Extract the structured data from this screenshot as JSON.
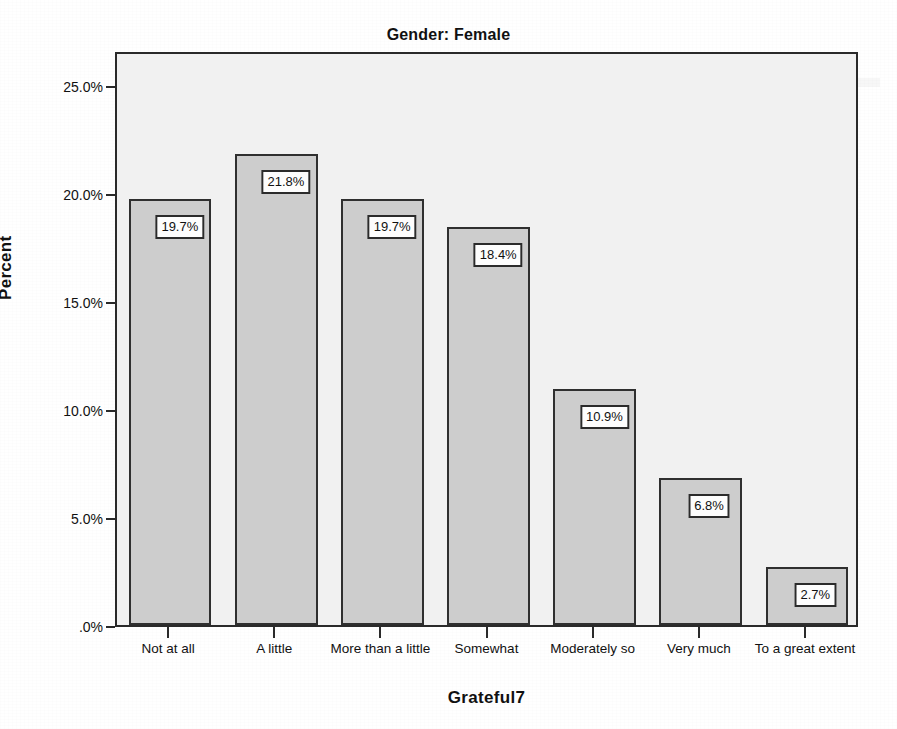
{
  "chart_data": {
    "type": "bar",
    "title": "Gender: Female",
    "xlabel": "Grateful7",
    "ylabel": "Percent",
    "categories": [
      "Not at all",
      "A little",
      "More than a little",
      "Somewhat",
      "Moderately so",
      "Very much",
      "To a great extent"
    ],
    "values": [
      19.7,
      21.8,
      19.7,
      18.4,
      10.9,
      6.8,
      2.7
    ],
    "value_labels": [
      "19.7%",
      "21.8%",
      "19.7%",
      "18.4%",
      "10.9%",
      "6.8%",
      "2.7%"
    ],
    "ylim": [
      0,
      26.6
    ],
    "ytick_values": [
      25.0,
      20.0,
      15.0,
      10.0,
      5.0,
      0.0
    ],
    "ytick_labels": [
      "25.0%",
      "20.0%",
      "15.0%",
      "10.0%",
      "5.0%",
      ".0%"
    ],
    "grid": false,
    "legend": null,
    "bar_color": "#cdcdcd",
    "bar_border_color": "#2f2f2f",
    "plot_background": "#f1f1f1",
    "page_background": "#ffffff",
    "text_color": "#111111"
  },
  "background_artifacts": {
    "note": "faint bleed-through from reverse page",
    "lines": [
      "",
      "",
      "",
      "",
      "",
      "",
      "",
      "",
      "",
      "",
      "",
      ""
    ]
  }
}
